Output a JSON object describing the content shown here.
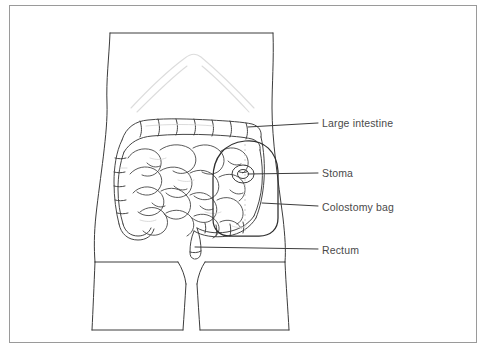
{
  "figure": {
    "border_color": "#9a9a9a",
    "line_color": "#3c3c3c",
    "faint_line_color": "#c8c8c8",
    "text_color": "#4a4a4a",
    "background": "#ffffff"
  },
  "labels": [
    {
      "id": "large-intestine",
      "text": "Large intestine",
      "text_x": 322,
      "text_y": 118,
      "leader": {
        "x1": 248,
        "y1": 127,
        "x2": 318,
        "y2": 123
      }
    },
    {
      "id": "stoma",
      "text": "Stoma",
      "text_x": 322,
      "text_y": 168,
      "leader": {
        "x1": 248,
        "y1": 174,
        "x2": 318,
        "y2": 173
      }
    },
    {
      "id": "colostomy-bag",
      "text": "Colostomy bag",
      "text_x": 322,
      "text_y": 202,
      "leader": {
        "x1": 262,
        "y1": 203,
        "x2": 318,
        "y2": 206
      }
    },
    {
      "id": "rectum",
      "text": "Rectum",
      "text_x": 322,
      "text_y": 245,
      "leader": {
        "x1": 195,
        "y1": 247,
        "x2": 318,
        "y2": 249
      }
    }
  ],
  "anatomy": {
    "torso": "front-view-torso-outline",
    "ribcage": "faint-rib-arch",
    "large_intestine": "colon-with-haustra",
    "small_intestine": "coiled-loops",
    "stoma": "abdominal-opening",
    "colostomy_bag": "rounded-pouch",
    "rectum": "lower-bowel-tube",
    "legs": "upper-thighs"
  }
}
